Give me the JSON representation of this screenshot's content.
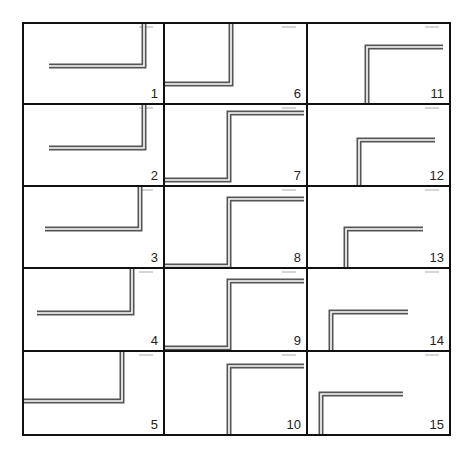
{
  "figure": {
    "layout": {
      "columns": 3,
      "rows": 5,
      "x_edges": [
        23,
        164,
        307,
        450
      ],
      "y_edges": [
        23,
        104,
        186,
        268,
        351,
        435
      ]
    },
    "colors": {
      "border": "#111111",
      "line_outer": "#555555",
      "line_inner": "#ffffff",
      "line_fill": "#8a8a8a",
      "label": "#222222"
    },
    "panels": [
      {
        "label": "1",
        "col": 0,
        "row": 0,
        "path": [
          [
            120,
            0
          ],
          [
            120,
            42
          ],
          [
            25,
            42
          ]
        ]
      },
      {
        "label": "2",
        "col": 0,
        "row": 1,
        "path": [
          [
            120,
            0
          ],
          [
            120,
            43
          ],
          [
            25,
            43
          ]
        ]
      },
      {
        "label": "3",
        "col": 0,
        "row": 2,
        "path": [
          [
            116,
            0
          ],
          [
            116,
            42
          ],
          [
            21,
            42
          ]
        ]
      },
      {
        "label": "4",
        "col": 0,
        "row": 3,
        "path": [
          [
            108,
            0
          ],
          [
            108,
            44
          ],
          [
            13,
            44
          ]
        ]
      },
      {
        "label": "5",
        "col": 0,
        "row": 4,
        "path": [
          [
            98,
            0
          ],
          [
            98,
            49
          ],
          [
            0,
            49
          ]
        ]
      },
      {
        "label": "6",
        "col": 1,
        "row": 0,
        "path": [
          [
            66,
            0
          ],
          [
            66,
            60
          ],
          [
            0,
            60
          ]
        ]
      },
      {
        "label": "7",
        "col": 1,
        "row": 1,
        "path": [
          [
            139,
            8
          ],
          [
            64,
            8
          ],
          [
            64,
            75
          ],
          [
            0,
            75
          ]
        ]
      },
      {
        "label": "8",
        "col": 1,
        "row": 2,
        "path": [
          [
            139,
            12
          ],
          [
            64,
            12
          ],
          [
            64,
            79
          ],
          [
            0,
            79
          ]
        ]
      },
      {
        "label": "9",
        "col": 1,
        "row": 3,
        "path": [
          [
            139,
            12
          ],
          [
            64,
            12
          ],
          [
            64,
            79
          ],
          [
            0,
            79
          ]
        ]
      },
      {
        "label": "10",
        "col": 1,
        "row": 4,
        "path": [
          [
            139,
            14
          ],
          [
            64,
            14
          ],
          [
            64,
            84
          ]
        ]
      },
      {
        "label": "11",
        "col": 2,
        "row": 0,
        "path": [
          [
            135,
            23
          ],
          [
            59,
            23
          ],
          [
            59,
            81
          ]
        ]
      },
      {
        "label": "12",
        "col": 2,
        "row": 1,
        "path": [
          [
            127,
            35
          ],
          [
            51,
            35
          ],
          [
            51,
            82
          ]
        ]
      },
      {
        "label": "13",
        "col": 2,
        "row": 2,
        "path": [
          [
            115,
            42
          ],
          [
            38,
            42
          ],
          [
            38,
            82
          ]
        ]
      },
      {
        "label": "14",
        "col": 2,
        "row": 3,
        "path": [
          [
            100,
            43
          ],
          [
            23,
            43
          ],
          [
            23,
            83
          ]
        ]
      },
      {
        "label": "15",
        "col": 2,
        "row": 4,
        "path": [
          [
            95,
            42
          ],
          [
            13,
            42
          ],
          [
            13,
            84
          ]
        ]
      }
    ]
  }
}
